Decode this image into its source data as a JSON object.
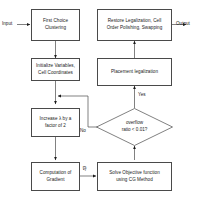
{
  "diagram": {
    "colors": {
      "stroke": "#4a4a4a",
      "text": "#1a1a1a",
      "background": "#ffffff",
      "arrow": "#1a1a1a"
    },
    "io": {
      "input_label": "Input",
      "output_label": "Output"
    },
    "nodes": [
      {
        "id": "first-choice-clustering",
        "shape": "process",
        "text": "First Choice\nClustering",
        "line1": "First Choice",
        "line2": "Clustering"
      },
      {
        "id": "restore-legalization",
        "shape": "process",
        "text": "Restore Legalization, Cell\nOrder Polishing, Swapping",
        "line1": "Restore Legalization, Cell",
        "line2": "Order Polishing, Swapping"
      },
      {
        "id": "initialize-variables",
        "shape": "process",
        "text": "Initialize Variables,\nCell Coordinates",
        "line1": "Initialize Variables,",
        "line2": "Cell Coordinates"
      },
      {
        "id": "placement-legalization",
        "shape": "process",
        "text": "Placement legalization",
        "line1": "Placement legalization",
        "line2": ""
      },
      {
        "id": "increase-lambda",
        "shape": "process",
        "text": "Increase λ by a\nfactor of 2",
        "line1": "Increase λ by a",
        "line2": "factor of 2"
      },
      {
        "id": "overflow-decision",
        "shape": "decision",
        "text": "overflow\nratio < 0.01?",
        "line1": "overflow",
        "line2": "ratio < 0.01?"
      },
      {
        "id": "computation-of-gradient",
        "shape": "process",
        "text": "Computation of\nGradient",
        "line1": "Computation of",
        "line2": "Gradient"
      },
      {
        "id": "solve-objective-function",
        "shape": "process",
        "text": "Solve Objective function\nusing CG Method",
        "line1": "Solve Objective function",
        "line2": "using CG Method"
      }
    ],
    "edge_labels": {
      "yes": "Yes",
      "no": "No",
      "gradient": "∇f"
    }
  }
}
